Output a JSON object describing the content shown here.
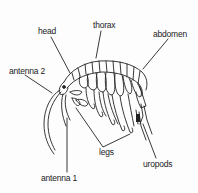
{
  "diagram": {
    "labels": {
      "head": "head",
      "thorax": "thorax",
      "abdomen": "abdomen",
      "antenna2": "antenna 2",
      "antenna1": "antenna 1",
      "legs": "legs",
      "uropods": "uropods"
    },
    "colors": {
      "line": "#222222",
      "background": "#fdfdfd",
      "text": "#222222"
    }
  }
}
